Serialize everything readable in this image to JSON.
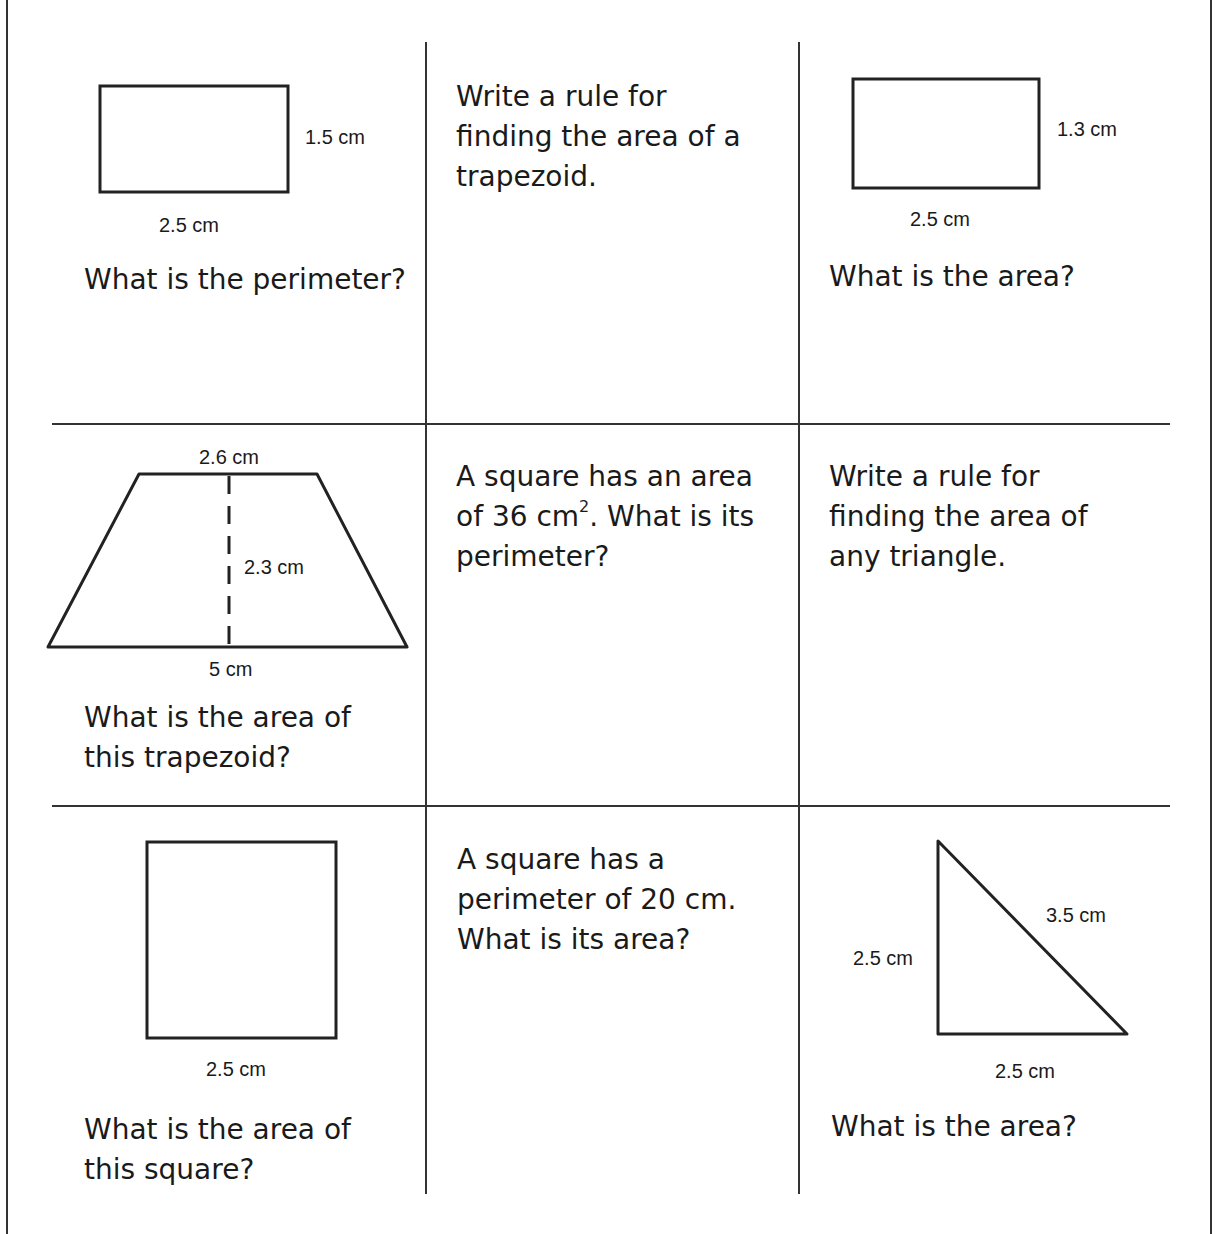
{
  "worksheet": {
    "cells": [
      {
        "id": "r1c1",
        "shape": "rectangle",
        "labels": {
          "height": "1.5 cm",
          "width": "2.5 cm"
        },
        "question": "What is the perimeter?"
      },
      {
        "id": "r1c2",
        "question": "Write a rule for finding the area of a trapezoid."
      },
      {
        "id": "r1c3",
        "shape": "rectangle",
        "labels": {
          "height": "1.3 cm",
          "width": "2.5 cm"
        },
        "question": "What is the area?"
      },
      {
        "id": "r2c1",
        "shape": "trapezoid",
        "labels": {
          "top": "2.6 cm",
          "height": "2.3 cm",
          "bottom": "5 cm"
        },
        "question_line1": "What is the area of",
        "question_line2": "this trapezoid?"
      },
      {
        "id": "r2c2",
        "question_pre": "A square has an area of 36 cm",
        "question_sup": "2",
        "question_post": ". What is its perimeter?"
      },
      {
        "id": "r2c3",
        "question": "Write a rule for finding the area of any triangle."
      },
      {
        "id": "r3c1",
        "shape": "square",
        "labels": {
          "side": "2.5 cm"
        },
        "question_line1": "What is the area of",
        "question_line2": "this square?"
      },
      {
        "id": "r3c2",
        "question": "A square has a perimeter of 20 cm. What is its area?"
      },
      {
        "id": "r3c3",
        "shape": "right-triangle",
        "labels": {
          "hypotenuse": "3.5 cm",
          "leg_vertical": "2.5 cm",
          "leg_horizontal": "2.5 cm"
        },
        "question": "What is the area?"
      }
    ]
  }
}
